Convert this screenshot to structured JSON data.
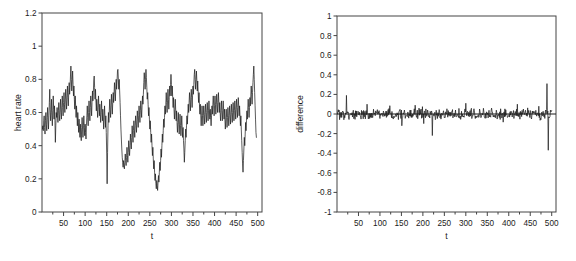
{
  "figure": {
    "type": "multi-panel-line-chart",
    "background": "#ffffff",
    "line_color": "#1a1a1a",
    "axis_color": "#444444",
    "panel_count": 2
  },
  "chart_data": [
    {
      "type": "line",
      "panel": "left",
      "title": "",
      "xlabel": "t",
      "ylabel": "heart rate",
      "xlim": [
        0,
        510
      ],
      "ylim": [
        0,
        1.2
      ],
      "xticks": [
        50,
        100,
        150,
        200,
        250,
        300,
        350,
        400,
        450,
        500
      ],
      "xtick_labels": [
        "50",
        "100",
        "150",
        "200",
        "250",
        "300",
        "350",
        "400",
        "450",
        "500"
      ],
      "yticks": [
        0,
        0.2,
        0.4,
        0.6,
        0.8,
        1,
        1.2
      ],
      "ytick_labels": [
        "0",
        "0.2",
        "0.4",
        "0.6",
        "0.8",
        "1",
        "1.2"
      ],
      "grid": false,
      "legend": false,
      "x": [
        1,
        2,
        3,
        4,
        5,
        6,
        7,
        8,
        9,
        10,
        11,
        12,
        13,
        14,
        15,
        16,
        17,
        18,
        19,
        20,
        21,
        22,
        23,
        24,
        25,
        26,
        27,
        28,
        29,
        30,
        31,
        32,
        33,
        34,
        35,
        36,
        37,
        38,
        39,
        40,
        41,
        42,
        43,
        44,
        45,
        46,
        47,
        48,
        49,
        50,
        51,
        52,
        53,
        54,
        55,
        56,
        57,
        58,
        59,
        60,
        61,
        62,
        63,
        64,
        65,
        66,
        67,
        68,
        69,
        70,
        71,
        72,
        73,
        74,
        75,
        76,
        77,
        78,
        79,
        80,
        81,
        82,
        83,
        84,
        85,
        86,
        87,
        88,
        89,
        90,
        91,
        92,
        93,
        94,
        95,
        96,
        97,
        98,
        99,
        100,
        101,
        102,
        103,
        104,
        105,
        106,
        107,
        108,
        109,
        110,
        111,
        112,
        113,
        114,
        115,
        116,
        117,
        118,
        119,
        120,
        121,
        122,
        123,
        124,
        125,
        126,
        127,
        128,
        129,
        130,
        131,
        132,
        133,
        134,
        135,
        136,
        137,
        138,
        139,
        140,
        141,
        142,
        143,
        144,
        145,
        146,
        147,
        148,
        149,
        150,
        151,
        152,
        153,
        154,
        155,
        156,
        157,
        158,
        159,
        160,
        161,
        162,
        163,
        164,
        165,
        166,
        167,
        168,
        169,
        170,
        171,
        172,
        173,
        174,
        175,
        176,
        177,
        178,
        179,
        180,
        181,
        182,
        183,
        184,
        185,
        186,
        187,
        188,
        189,
        190,
        191,
        192,
        193,
        194,
        195,
        196,
        197,
        198,
        199,
        200,
        201,
        202,
        203,
        204,
        205,
        206,
        207,
        208,
        209,
        210,
        211,
        212,
        213,
        214,
        215,
        216,
        217,
        218,
        219,
        220,
        221,
        222,
        223,
        224,
        225,
        226,
        227,
        228,
        229,
        230,
        231,
        232,
        233,
        234,
        235,
        236,
        237,
        238,
        239,
        240,
        241,
        242,
        243,
        244,
        245,
        246,
        247,
        248,
        249,
        250,
        251,
        252,
        253,
        254,
        255,
        256,
        257,
        258,
        259,
        260,
        261,
        262,
        263,
        264,
        265,
        266,
        267,
        268,
        269,
        270,
        271,
        272,
        273,
        274,
        275,
        276,
        277,
        278,
        279,
        280,
        281,
        282,
        283,
        284,
        285,
        286,
        287,
        288,
        289,
        290,
        291,
        292,
        293,
        294,
        295,
        296,
        297,
        298,
        299,
        300,
        301,
        302,
        303,
        304,
        305,
        306,
        307,
        308,
        309,
        310,
        311,
        312,
        313,
        314,
        315,
        316,
        317,
        318,
        319,
        320,
        321,
        322,
        323,
        324,
        325,
        326,
        327,
        328,
        329,
        330,
        331,
        332,
        333,
        334,
        335,
        336,
        337,
        338,
        339,
        340,
        341,
        342,
        343,
        344,
        345,
        346,
        347,
        348,
        349,
        350,
        351,
        352,
        353,
        354,
        355,
        356,
        357,
        358,
        359,
        360,
        361,
        362,
        363,
        364,
        365,
        366,
        367,
        368,
        369,
        370,
        371,
        372,
        373,
        374,
        375,
        376,
        377,
        378,
        379,
        380,
        381,
        382,
        383,
        384,
        385,
        386,
        387,
        388,
        389,
        390,
        391,
        392,
        393,
        394,
        395,
        396,
        397,
        398,
        399,
        400,
        401,
        402,
        403,
        404,
        405,
        406,
        407,
        408,
        409,
        410,
        411,
        412,
        413,
        414,
        415,
        416,
        417,
        418,
        419,
        420,
        421,
        422,
        423,
        424,
        425,
        426,
        427,
        428,
        429,
        430,
        431,
        432,
        433,
        434,
        435,
        436,
        437,
        438,
        439,
        440,
        441,
        442,
        443,
        444,
        445,
        446,
        447,
        448,
        449,
        450,
        451,
        452,
        453,
        454,
        455,
        456,
        457,
        458,
        459,
        460,
        461,
        462,
        463,
        464,
        465,
        466,
        467,
        468,
        469,
        470,
        471,
        472,
        473,
        474,
        475,
        476,
        477,
        478,
        479,
        480,
        481,
        482,
        483,
        484,
        485,
        486,
        487,
        488,
        489,
        490,
        491,
        492,
        493,
        494,
        495,
        496,
        497,
        498,
        499,
        500
      ],
      "values": [
        0.5,
        0.52,
        0.49,
        0.55,
        0.58,
        0.51,
        0.47,
        0.55,
        0.6,
        0.53,
        0.49,
        0.57,
        0.63,
        0.56,
        0.5,
        0.58,
        0.66,
        0.74,
        0.62,
        0.55,
        0.6,
        0.68,
        0.58,
        0.52,
        0.61,
        0.7,
        0.62,
        0.56,
        0.64,
        0.55,
        0.42,
        0.52,
        0.6,
        0.57,
        0.63,
        0.58,
        0.54,
        0.61,
        0.66,
        0.59,
        0.55,
        0.62,
        0.68,
        0.6,
        0.56,
        0.64,
        0.7,
        0.63,
        0.58,
        0.66,
        0.72,
        0.65,
        0.6,
        0.68,
        0.74,
        0.67,
        0.62,
        0.7,
        0.76,
        0.69,
        0.64,
        0.72,
        0.78,
        0.71,
        0.75,
        0.82,
        0.88,
        0.8,
        0.73,
        0.79,
        0.85,
        0.77,
        0.7,
        0.76,
        0.68,
        0.62,
        0.7,
        0.64,
        0.57,
        0.64,
        0.58,
        0.52,
        0.6,
        0.54,
        0.48,
        0.56,
        0.5,
        0.45,
        0.53,
        0.47,
        0.43,
        0.51,
        0.57,
        0.5,
        0.45,
        0.52,
        0.58,
        0.51,
        0.46,
        0.53,
        0.48,
        0.44,
        0.52,
        0.58,
        0.64,
        0.57,
        0.52,
        0.6,
        0.67,
        0.6,
        0.55,
        0.63,
        0.7,
        0.64,
        0.58,
        0.66,
        0.73,
        0.67,
        0.72,
        0.79,
        0.82,
        0.75,
        0.68,
        0.74,
        0.67,
        0.61,
        0.68,
        0.62,
        0.57,
        0.64,
        0.7,
        0.63,
        0.58,
        0.65,
        0.59,
        0.54,
        0.61,
        0.67,
        0.6,
        0.55,
        0.62,
        0.56,
        0.5,
        0.58,
        0.64,
        0.57,
        0.51,
        0.58,
        0.48,
        0.35,
        0.17,
        0.36,
        0.52,
        0.6,
        0.54,
        0.61,
        0.68,
        0.62,
        0.57,
        0.64,
        0.71,
        0.65,
        0.59,
        0.66,
        0.72,
        0.66,
        0.71,
        0.78,
        0.73,
        0.67,
        0.74,
        0.8,
        0.74,
        0.79,
        0.85,
        0.86,
        0.8,
        0.74,
        0.8,
        0.73,
        0.66,
        0.58,
        0.5,
        0.44,
        0.38,
        0.33,
        0.3,
        0.27,
        0.31,
        0.28,
        0.26,
        0.3,
        0.35,
        0.31,
        0.28,
        0.33,
        0.39,
        0.34,
        0.3,
        0.36,
        0.43,
        0.38,
        0.34,
        0.4,
        0.47,
        0.42,
        0.38,
        0.45,
        0.52,
        0.47,
        0.42,
        0.49,
        0.55,
        0.5,
        0.45,
        0.52,
        0.58,
        0.53,
        0.48,
        0.55,
        0.61,
        0.56,
        0.51,
        0.58,
        0.64,
        0.59,
        0.54,
        0.61,
        0.67,
        0.62,
        0.57,
        0.64,
        0.7,
        0.65,
        0.71,
        0.78,
        0.84,
        0.8,
        0.74,
        0.8,
        0.86,
        0.81,
        0.75,
        0.68,
        0.72,
        0.65,
        0.58,
        0.63,
        0.56,
        0.5,
        0.55,
        0.48,
        0.42,
        0.47,
        0.4,
        0.34,
        0.39,
        0.32,
        0.26,
        0.31,
        0.24,
        0.19,
        0.23,
        0.17,
        0.14,
        0.19,
        0.16,
        0.13,
        0.18,
        0.22,
        0.18,
        0.24,
        0.3,
        0.25,
        0.31,
        0.38,
        0.33,
        0.4,
        0.47,
        0.42,
        0.49,
        0.56,
        0.51,
        0.57,
        0.64,
        0.59,
        0.65,
        0.72,
        0.66,
        0.6,
        0.67,
        0.74,
        0.68,
        0.62,
        0.69,
        0.76,
        0.7,
        0.77,
        0.83,
        0.77,
        0.7,
        0.76,
        0.69,
        0.63,
        0.69,
        0.62,
        0.56,
        0.62,
        0.68,
        0.61,
        0.55,
        0.61,
        0.54,
        0.48,
        0.54,
        0.6,
        0.53,
        0.47,
        0.53,
        0.59,
        0.52,
        0.46,
        0.52,
        0.58,
        0.51,
        0.45,
        0.51,
        0.43,
        0.38,
        0.3,
        0.36,
        0.43,
        0.5,
        0.45,
        0.52,
        0.58,
        0.53,
        0.59,
        0.65,
        0.6,
        0.66,
        0.72,
        0.67,
        0.61,
        0.68,
        0.74,
        0.69,
        0.63,
        0.7,
        0.76,
        0.71,
        0.77,
        0.83,
        0.86,
        0.8,
        0.74,
        0.8,
        0.85,
        0.79,
        0.73,
        0.79,
        0.72,
        0.66,
        0.72,
        0.65,
        0.59,
        0.65,
        0.58,
        0.52,
        0.58,
        0.64,
        0.58,
        0.52,
        0.58,
        0.64,
        0.59,
        0.53,
        0.59,
        0.65,
        0.6,
        0.54,
        0.6,
        0.66,
        0.61,
        0.55,
        0.61,
        0.67,
        0.62,
        0.56,
        0.62,
        0.57,
        0.52,
        0.58,
        0.64,
        0.59,
        0.65,
        0.7,
        0.64,
        0.58,
        0.64,
        0.7,
        0.65,
        0.59,
        0.65,
        0.71,
        0.66,
        0.6,
        0.66,
        0.72,
        0.66,
        0.6,
        0.66,
        0.6,
        0.55,
        0.61,
        0.67,
        0.61,
        0.55,
        0.61,
        0.67,
        0.62,
        0.56,
        0.62,
        0.56,
        0.5,
        0.56,
        0.62,
        0.57,
        0.51,
        0.57,
        0.63,
        0.58,
        0.52,
        0.58,
        0.64,
        0.59,
        0.53,
        0.59,
        0.65,
        0.6,
        0.54,
        0.6,
        0.66,
        0.61,
        0.55,
        0.61,
        0.67,
        0.62,
        0.56,
        0.62,
        0.68,
        0.63,
        0.57,
        0.63,
        0.69,
        0.64,
        0.58,
        0.64,
        0.58,
        0.52,
        0.58,
        0.5,
        0.43,
        0.36,
        0.29,
        0.24,
        0.31,
        0.38,
        0.45,
        0.4,
        0.47,
        0.54,
        0.49,
        0.55,
        0.61,
        0.56,
        0.62,
        0.68,
        0.63,
        0.57,
        0.63,
        0.69,
        0.64,
        0.7,
        0.76,
        0.71,
        0.65,
        0.72,
        0.78,
        0.83,
        0.88,
        0.8,
        0.72,
        0.64,
        0.56,
        0.48,
        0.45
      ]
    },
    {
      "type": "line",
      "panel": "right",
      "title": "",
      "xlabel": "t",
      "ylabel": "difference",
      "xlim": [
        0,
        510
      ],
      "ylim": [
        -1,
        1
      ],
      "xticks": [
        50,
        100,
        150,
        200,
        250,
        300,
        350,
        400,
        450,
        500
      ],
      "xtick_labels": [
        "50",
        "100",
        "150",
        "200",
        "250",
        "300",
        "350",
        "400",
        "450",
        "500"
      ],
      "yticks": [
        -1,
        -0.8,
        -0.6,
        -0.4,
        -0.2,
        0,
        0.2,
        0.4,
        0.6,
        0.8,
        1
      ],
      "ytick_labels": [
        "-1",
        "-0.8",
        "-0.6",
        "-0.4",
        "-0.2",
        "0",
        "0.2",
        "0.4",
        "0.6",
        "0.8",
        "1"
      ],
      "grid": false,
      "legend": false,
      "reference_line": 0,
      "noise_band": [
        -0.08,
        0.08
      ],
      "notable_features": [
        {
          "t": 22,
          "value": 0.19,
          "kind": "positive-spike"
        },
        {
          "t": 70,
          "value": 0.1,
          "kind": "positive-spike"
        },
        {
          "t": 151,
          "value": -0.12,
          "kind": "negative-spike"
        },
        {
          "t": 182,
          "value": 0.09,
          "kind": "positive-spike"
        },
        {
          "t": 222,
          "value": -0.22,
          "kind": "negative-spike"
        },
        {
          "t": 300,
          "value": 0.11,
          "kind": "positive-spike"
        },
        {
          "t": 420,
          "value": 0.1,
          "kind": "positive-spike"
        },
        {
          "t": 489,
          "value": 0.31,
          "kind": "positive-spike"
        },
        {
          "t": 492,
          "value": -0.37,
          "kind": "negative-spike"
        }
      ]
    }
  ]
}
